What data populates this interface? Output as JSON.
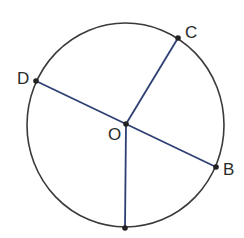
{
  "diagram": {
    "type": "circle-with-radii",
    "colors": {
      "circle_stroke": "#3a3a3a",
      "segment_stroke": "#2e3f74",
      "point_fill": "#222222",
      "label_color": "#2a2a2a",
      "background": "#ffffff"
    },
    "circle": {
      "cx": 125.5,
      "cy": 125,
      "rx": 98.5,
      "ry": 102
    },
    "points": {
      "O": {
        "label": "O",
        "x": 126,
        "y": 124
      },
      "C": {
        "label": "C",
        "x": 178,
        "y": 38
      },
      "D": {
        "label": "D",
        "x": 36,
        "y": 81
      },
      "B": {
        "label": "B",
        "x": 216,
        "y": 167
      },
      "A": {
        "label": "",
        "x": 125,
        "y": 228
      }
    },
    "segments": [
      {
        "from": "D",
        "to": "B",
        "name": "diameter-DB"
      },
      {
        "from": "O",
        "to": "C",
        "name": "radius-OC"
      },
      {
        "from": "O",
        "to": "A",
        "name": "radius-OA"
      }
    ],
    "labels": {
      "O": "O",
      "C": "C",
      "D": "D",
      "B": "B"
    }
  }
}
